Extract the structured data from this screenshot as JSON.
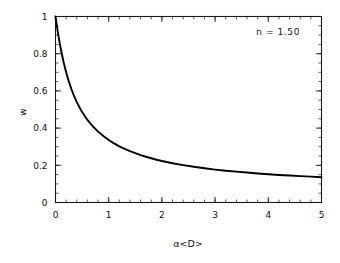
{
  "chart_data": {
    "type": "line",
    "title": "",
    "subtitle": "",
    "xlabel": "α<D>",
    "ylabel": "w",
    "xlim": [
      0,
      5
    ],
    "ylim": [
      0,
      1
    ],
    "grid": false,
    "legend": "none",
    "annotations": [
      {
        "text": "n  =  1.50",
        "x": 4.1,
        "y": 0.93
      }
    ],
    "x_ticks_major": [
      0,
      1,
      2,
      3,
      4,
      5
    ],
    "x_tick_labels": [
      "0",
      "1",
      "2",
      "3",
      "4",
      "5"
    ],
    "x_ticks_minor_step": 0.2,
    "y_ticks_major": [
      0,
      0.2,
      0.4,
      0.6,
      0.8,
      1
    ],
    "y_tick_labels": [
      "0",
      "0.2",
      "0.4",
      "0.6",
      "0.8",
      "1"
    ],
    "y_ticks_minor_step": 0.05,
    "series": [
      {
        "name": "w",
        "x": [
          0.0,
          0.02,
          0.05,
          0.08,
          0.1,
          0.15,
          0.2,
          0.25,
          0.3,
          0.35,
          0.4,
          0.45,
          0.5,
          0.6,
          0.7,
          0.8,
          0.9,
          1.0,
          1.1,
          1.2,
          1.3,
          1.4,
          1.5,
          1.6,
          1.7,
          1.8,
          1.9,
          2.0,
          2.2,
          2.4,
          2.6,
          2.8,
          3.0,
          3.2,
          3.4,
          3.6,
          3.8,
          4.0,
          4.2,
          4.4,
          4.6,
          4.8,
          5.0
        ],
        "values": [
          1.0,
          0.96,
          0.905,
          0.855,
          0.825,
          0.757,
          0.7,
          0.651,
          0.609,
          0.572,
          0.54,
          0.512,
          0.487,
          0.444,
          0.41,
          0.381,
          0.357,
          0.336,
          0.318,
          0.302,
          0.288,
          0.276,
          0.265,
          0.255,
          0.246,
          0.238,
          0.23,
          0.223,
          0.211,
          0.201,
          0.192,
          0.184,
          0.177,
          0.171,
          0.166,
          0.161,
          0.156,
          0.152,
          0.148,
          0.145,
          0.142,
          0.139,
          0.136
        ]
      }
    ]
  },
  "figure": {
    "background_color": "#ffffff",
    "curve_color": "#000000",
    "axis_color": "#1a1a1a"
  }
}
